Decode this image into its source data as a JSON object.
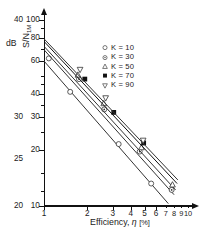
{
  "chart_data": {
    "type": "line",
    "title": "",
    "xlabel": "Efficiency, η [%]",
    "ylabel": "S/N₁ₘ",
    "ylabel_secondary": "dB",
    "xscale": "log",
    "yscale": "log",
    "xlim": [
      1,
      10
    ],
    "ylim": [
      10,
      110
    ],
    "grid": false,
    "legend_position": "upper right",
    "x_ticks": [
      "1",
      "2",
      "3",
      "4",
      "5",
      "6",
      "7",
      "8",
      "9",
      "10"
    ],
    "x_tick_values": [
      1,
      2,
      3,
      4,
      5,
      6,
      7,
      8,
      9,
      10
    ],
    "y_ticks": [
      "100",
      "80",
      "60",
      "40",
      "30",
      "20",
      "10"
    ],
    "y_tick_values": [
      100,
      80,
      60,
      40,
      30,
      20,
      10
    ],
    "y_ticks_db": [
      "40",
      "30",
      "25",
      "20"
    ],
    "y_tick_db_values": [
      40,
      30,
      25,
      20
    ],
    "y_tick_db_at_sn": [
      100,
      30,
      17.8,
      10
    ],
    "series": [
      {
        "name": "K = 10",
        "marker": "open-circle",
        "color": "#333333",
        "line": [
          [
            1.0,
            60.0
          ],
          [
            7.3,
            10.3
          ]
        ],
        "points": [
          [
            1.08,
            62.0
          ],
          [
            1.52,
            41.0
          ],
          [
            3.3,
            21.5
          ],
          [
            5.55,
            13.2
          ]
        ]
      },
      {
        "name": "K = 30",
        "marker": "dotted-circle",
        "color": "#333333",
        "line": [
          [
            1.0,
            69.0
          ],
          [
            8.0,
            11.5
          ]
        ],
        "points": [
          [
            1.75,
            48.0
          ],
          [
            2.62,
            33.0
          ],
          [
            4.62,
            19.6
          ],
          [
            7.7,
            12.2
          ]
        ]
      },
      {
        "name": "K = 50",
        "marker": "open-triangle",
        "color": "#333333",
        "line": [
          [
            1.0,
            72.0
          ],
          [
            8.2,
            12.2
          ]
        ],
        "points": [
          [
            1.72,
            50.5
          ],
          [
            2.6,
            35.5
          ],
          [
            4.75,
            20.6
          ],
          [
            7.8,
            13.0
          ]
        ]
      },
      {
        "name": "K = 70",
        "marker": "filled-square",
        "color": "#111111",
        "line": [
          [
            1.0,
            76.5
          ],
          [
            8.4,
            13.2
          ]
        ],
        "points": [
          [
            1.92,
            48.0
          ],
          [
            3.05,
            31.8
          ],
          [
            4.92,
            21.8
          ]
        ]
      },
      {
        "name": "K = 90",
        "marker": "open-down-triangle",
        "color": "#333333",
        "line": [
          [
            1.0,
            79.0
          ],
          [
            8.5,
            13.8
          ]
        ],
        "points": [
          [
            1.78,
            54.0
          ],
          [
            2.68,
            38.0
          ],
          [
            4.88,
            22.5
          ]
        ]
      }
    ]
  },
  "legend": {
    "items": [
      {
        "label": "K = 10",
        "marker": "open-circle"
      },
      {
        "label": "K = 30",
        "marker": "dotted-circle"
      },
      {
        "label": "K = 50",
        "marker": "open-triangle"
      },
      {
        "label": "K = 70",
        "marker": "filled-square"
      },
      {
        "label": "K = 90",
        "marker": "open-down-triangle"
      }
    ]
  },
  "axis_titles": {
    "db": "dB",
    "y_main": "S/N",
    "y_sub": "1M",
    "x_prefix": "Efficiency, ",
    "x_symbol": "η",
    "x_unit": "[%]"
  }
}
